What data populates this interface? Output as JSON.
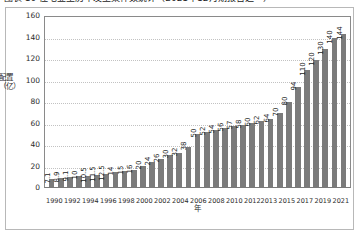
{
  "caption": "图表 10  住宅业主历年发生案件数统计（2021年12月期报告之一）",
  "chart_data": {
    "type": "bar",
    "title": "",
    "xlabel": "年",
    "ylabel": "配置（亿）",
    "ylim": [
      0,
      160
    ],
    "yticks": [
      160,
      140,
      120,
      100,
      80,
      60,
      40,
      20,
      0
    ],
    "grid": true,
    "legend": "none",
    "bar_color": "#7b7b7b",
    "categories": [
      "1990",
      "1991",
      "1992",
      "1993",
      "1994",
      "1995",
      "1996",
      "1997",
      "1998",
      "1999",
      "2000",
      "2001",
      "2002",
      "2003",
      "2004",
      "2005",
      "2006",
      "2007",
      "2008",
      "2009",
      "2010",
      "2011",
      "2012",
      "2013",
      "2014",
      "2015",
      "2016",
      "2017",
      "2018",
      "2019",
      "2020",
      "2021"
    ],
    "tick_labels": [
      "1990",
      "",
      "1992",
      "",
      "1994",
      "",
      "1996",
      "",
      "1998",
      "",
      "2000",
      "",
      "2002",
      "",
      "2004",
      "",
      "2006",
      "",
      "2008",
      "",
      "2010",
      "",
      "2012",
      "2013",
      "",
      "2015",
      "",
      "2017",
      "",
      "2019",
      "",
      "2021"
    ],
    "values": [
      7.1,
      8.9,
      9.1,
      10,
      10.5,
      11.5,
      12.5,
      14,
      15,
      16,
      20,
      24,
      26,
      30,
      32,
      38,
      50,
      52,
      54,
      56,
      57,
      58,
      60,
      62,
      64,
      70,
      80,
      94,
      110,
      120,
      130,
      140
    ],
    "data_labels": [
      "7.1",
      "8.9",
      "9.1",
      "10",
      "10.5",
      "11.5",
      "12.5",
      "14",
      "15",
      "16",
      "20",
      "24",
      "26",
      "30",
      "32",
      "38",
      "50",
      "52",
      "54",
      "56",
      "57",
      "58",
      "60",
      "62",
      "64",
      "70",
      "80",
      "94",
      "110",
      "120",
      "130",
      "140"
    ],
    "last_value": 144,
    "last_label": "144"
  }
}
